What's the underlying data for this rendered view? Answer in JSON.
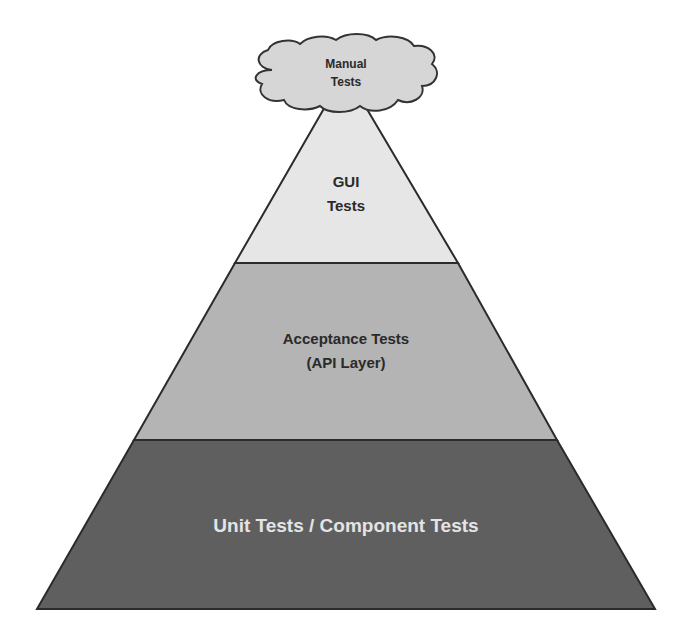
{
  "diagram": {
    "type": "test-automation-pyramid",
    "cloud": {
      "lines": [
        "Manual",
        "Tests"
      ],
      "fill": "#d6d6d6",
      "stroke": "#333333",
      "text_color": "#2a2a2a"
    },
    "layers": [
      {
        "id": "gui",
        "lines": [
          "GUI",
          "Tests"
        ],
        "fill": "#e6e6e6",
        "text_color": "#2a2a2a"
      },
      {
        "id": "acceptance",
        "lines": [
          "Acceptance Tests",
          "(API Layer)"
        ],
        "fill": "#b4b4b4",
        "text_color": "#2a2a2a"
      },
      {
        "id": "unit",
        "lines": [
          "Unit Tests / Component Tests"
        ],
        "fill": "#5f5f5f",
        "text_color": "#e4e4e4"
      }
    ],
    "outline_color": "#2b2b2b"
  }
}
